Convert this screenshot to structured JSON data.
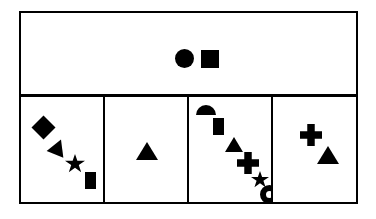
{
  "figure": {
    "title": "",
    "background_color": "#ffffff",
    "stroke_color": "#000000",
    "fill_color": "#000000",
    "layout": "one wide top panel above a row of four equal panels",
    "panel_count": 5
  },
  "top_panel": {
    "name": "top-panel",
    "shapes": [
      {
        "type": "circle",
        "label": "circle",
        "fill": "#000000"
      },
      {
        "type": "square",
        "label": "square",
        "fill": "#000000"
      }
    ]
  },
  "bottom_panels": [
    {
      "name": "panel-1",
      "index": 1,
      "shapes": [
        {
          "type": "diamond",
          "label": "diamond",
          "fill": "#000000"
        },
        {
          "type": "triangle",
          "label": "triangle",
          "fill": "#000000"
        },
        {
          "type": "star",
          "label": "star",
          "fill": "#000000"
        },
        {
          "type": "rectangle",
          "label": "rectangle",
          "fill": "#000000"
        }
      ]
    },
    {
      "name": "panel-2",
      "index": 2,
      "shapes": [
        {
          "type": "triangle",
          "label": "triangle",
          "fill": "#000000"
        }
      ]
    },
    {
      "name": "panel-3",
      "index": 3,
      "shapes": [
        {
          "type": "semicircle",
          "label": "semicircle",
          "fill": "#000000"
        },
        {
          "type": "rectangle",
          "label": "rectangle",
          "fill": "#000000"
        },
        {
          "type": "triangle",
          "label": "triangle",
          "fill": "#000000"
        },
        {
          "type": "plus",
          "label": "plus",
          "fill": "#000000"
        },
        {
          "type": "star",
          "label": "star",
          "fill": "#000000"
        },
        {
          "type": "ring",
          "label": "ring",
          "fill": "#000000"
        }
      ]
    },
    {
      "name": "panel-4",
      "index": 4,
      "shapes": [
        {
          "type": "plus",
          "label": "plus",
          "fill": "#000000"
        },
        {
          "type": "triangle",
          "label": "triangle",
          "fill": "#000000"
        }
      ]
    }
  ]
}
